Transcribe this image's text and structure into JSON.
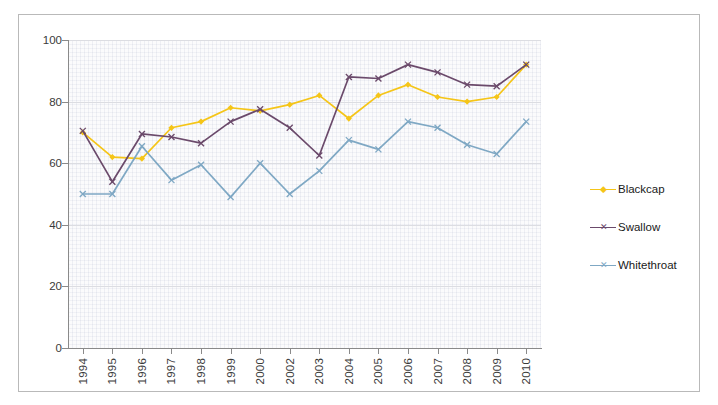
{
  "chart_data": {
    "type": "line",
    "title": "",
    "subtitle": "",
    "xlabel": "",
    "ylabel": "",
    "ylim": [
      0,
      100
    ],
    "yticks": [
      0,
      20,
      40,
      60,
      80,
      100
    ],
    "grid": true,
    "legend_position": "right",
    "categories": [
      "1994",
      "1995",
      "1996",
      "1997",
      "1998",
      "1999",
      "2000",
      "2002",
      "2003",
      "2004",
      "2005",
      "2006",
      "2007",
      "2008",
      "2009",
      "2010"
    ],
    "series": [
      {
        "name": "Blackcap",
        "color": "#f5c518",
        "marker": "diamond",
        "values": [
          70,
          62,
          61.5,
          71.5,
          73.5,
          78,
          77,
          79,
          82,
          74.5,
          82,
          85.5,
          81.5,
          80,
          81.5,
          92
        ]
      },
      {
        "name": "Swallow",
        "color": "#6b4a6b",
        "marker": "x",
        "values": [
          70.5,
          54,
          69.5,
          68.5,
          66.5,
          73.5,
          77.5,
          71.5,
          62.5,
          88,
          87.5,
          92,
          89.5,
          85.5,
          85,
          92
        ]
      },
      {
        "name": "Whitethroat",
        "color": "#7fa8c4",
        "marker": "x",
        "values": [
          50,
          50,
          65.5,
          54.5,
          59.5,
          49,
          60,
          50,
          57.5,
          67.5,
          64.5,
          73.5,
          71.5,
          66,
          63,
          73.5
        ]
      }
    ]
  },
  "legend": {
    "items": [
      {
        "label": "Blackcap"
      },
      {
        "label": "Swallow"
      },
      {
        "label": "Whitethroat"
      }
    ]
  },
  "axes": {
    "y_tick_labels": [
      "100",
      "80",
      "60",
      "40",
      "20",
      "0"
    ],
    "x_tick_labels": [
      "1994",
      "1995",
      "1996",
      "1997",
      "1998",
      "1999",
      "2000",
      "2002",
      "2003",
      "2004",
      "2005",
      "2006",
      "2007",
      "2008",
      "2009",
      "2010"
    ]
  }
}
